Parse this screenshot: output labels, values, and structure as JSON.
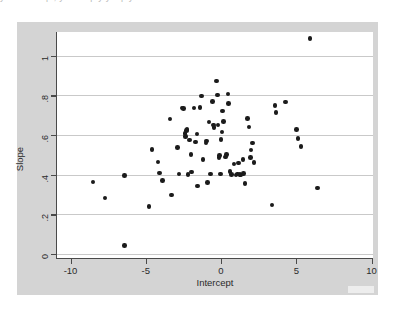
{
  "page": {
    "top_text_remnant": "y u v e v u p , y u u u p y y u p y",
    "background_color": "#ffffff"
  },
  "figure": {
    "graph_region_color": "#d4d4d4",
    "plot_region_color": "#ffffff",
    "gridline_color": "#c9c9c9",
    "axis_color": "#4a4a4a",
    "marker_color": "#1b1b1b"
  },
  "chart_data": {
    "type": "scatter",
    "title": "",
    "xlabel": "Intercept",
    "ylabel": "Slope",
    "xlim": [
      -10.9,
      10.1
    ],
    "ylim": [
      -0.02,
      1.12
    ],
    "xticks": [
      -10,
      -5,
      0,
      5,
      10
    ],
    "xtick_labels": [
      "-10",
      "-5",
      "0",
      "5",
      "10"
    ],
    "yticks": [
      0,
      0.2,
      0.4,
      0.6,
      0.8,
      1
    ],
    "ytick_labels": [
      "0",
      ".2",
      ".4",
      ".6",
      ".8",
      "1"
    ],
    "grid": "horizontal",
    "legend": null,
    "marker": "filled-circle",
    "n_points": 78,
    "points": [
      [
        -8.5,
        0.363
      ],
      [
        -7.7,
        0.282
      ],
      [
        -6.4,
        0.396
      ],
      [
        -6.4,
        0.042
      ],
      [
        -4.8,
        0.241
      ],
      [
        -4.6,
        0.528
      ],
      [
        -4.2,
        0.463
      ],
      [
        -4.1,
        0.408
      ],
      [
        -3.9,
        0.372
      ],
      [
        -3.4,
        0.681
      ],
      [
        -3.3,
        0.299
      ],
      [
        -2.9,
        0.537
      ],
      [
        -2.8,
        0.404
      ],
      [
        -2.6,
        0.737
      ],
      [
        -2.5,
        0.733
      ],
      [
        -2.4,
        0.607
      ],
      [
        -2.35,
        0.594
      ],
      [
        -2.3,
        0.622
      ],
      [
        -2.25,
        0.628
      ],
      [
        -2.1,
        0.574
      ],
      [
        -2.0,
        0.501
      ],
      [
        -1.95,
        0.413
      ],
      [
        -1.8,
        0.737
      ],
      [
        -1.7,
        0.566
      ],
      [
        -1.55,
        0.342
      ],
      [
        -1.4,
        0.738
      ],
      [
        -1.3,
        0.798
      ],
      [
        -1.2,
        0.478
      ],
      [
        -1.0,
        0.56
      ],
      [
        -0.95,
        0.57
      ],
      [
        -0.9,
        0.361
      ],
      [
        -0.8,
        0.667
      ],
      [
        -0.7,
        0.404
      ],
      [
        -0.55,
        0.77
      ],
      [
        -0.5,
        0.651
      ],
      [
        -0.45,
        0.639
      ],
      [
        -0.3,
        0.874
      ],
      [
        -0.25,
        0.803
      ],
      [
        -0.2,
        0.65
      ],
      [
        -0.15,
        0.488
      ],
      [
        -0.1,
        0.497
      ],
      [
        0.0,
        0.578
      ],
      [
        0.05,
        0.616
      ],
      [
        0.1,
        0.721
      ],
      [
        0.15,
        0.668
      ],
      [
        0.3,
        0.489
      ],
      [
        0.35,
        0.502
      ],
      [
        0.45,
        0.807
      ],
      [
        0.6,
        0.417
      ],
      [
        0.7,
        0.401
      ],
      [
        0.85,
        0.453
      ],
      [
        1.0,
        0.398
      ],
      [
        1.1,
        0.404
      ],
      [
        1.25,
        0.402
      ],
      [
        1.3,
        0.399
      ],
      [
        1.45,
        0.476
      ],
      [
        1.5,
        0.406
      ],
      [
        1.6,
        0.356
      ],
      [
        1.75,
        0.684
      ],
      [
        1.85,
        0.642
      ],
      [
        1.95,
        0.486
      ],
      [
        2.0,
        0.524
      ],
      [
        2.1,
        0.56
      ],
      [
        2.2,
        0.462
      ],
      [
        3.4,
        0.247
      ],
      [
        3.6,
        0.748
      ],
      [
        3.65,
        0.714
      ],
      [
        4.3,
        0.767
      ],
      [
        5.0,
        0.628
      ],
      [
        5.1,
        0.584
      ],
      [
        5.3,
        0.542
      ],
      [
        5.9,
        1.088
      ],
      [
        6.4,
        0.334
      ],
      [
        -1.6,
        0.605
      ],
      [
        0.5,
        0.76
      ],
      [
        1.15,
        0.46
      ],
      [
        -2.2,
        0.401
      ],
      [
        -0.05,
        0.404
      ]
    ]
  }
}
